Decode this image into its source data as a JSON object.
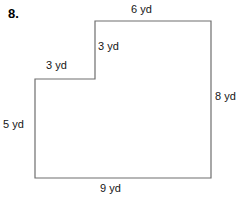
{
  "problem": {
    "number": "8."
  },
  "figure": {
    "name": "l-shaped-polygon",
    "stroke_color": "#6e6e6e",
    "fill_color": "#ffffff",
    "stroke_width": 1,
    "unit": "yd",
    "vertices": [
      {
        "x": 95,
        "y": 21
      },
      {
        "x": 211,
        "y": 21
      },
      {
        "x": 211,
        "y": 178
      },
      {
        "x": 35,
        "y": 178
      },
      {
        "x": 35,
        "y": 79
      },
      {
        "x": 95,
        "y": 79
      }
    ],
    "labels": {
      "top": "6 yd",
      "step_vertical": "3 yd",
      "step_horizontal": "3 yd",
      "left": "5 yd",
      "right": "8 yd",
      "bottom": "9 yd"
    }
  }
}
